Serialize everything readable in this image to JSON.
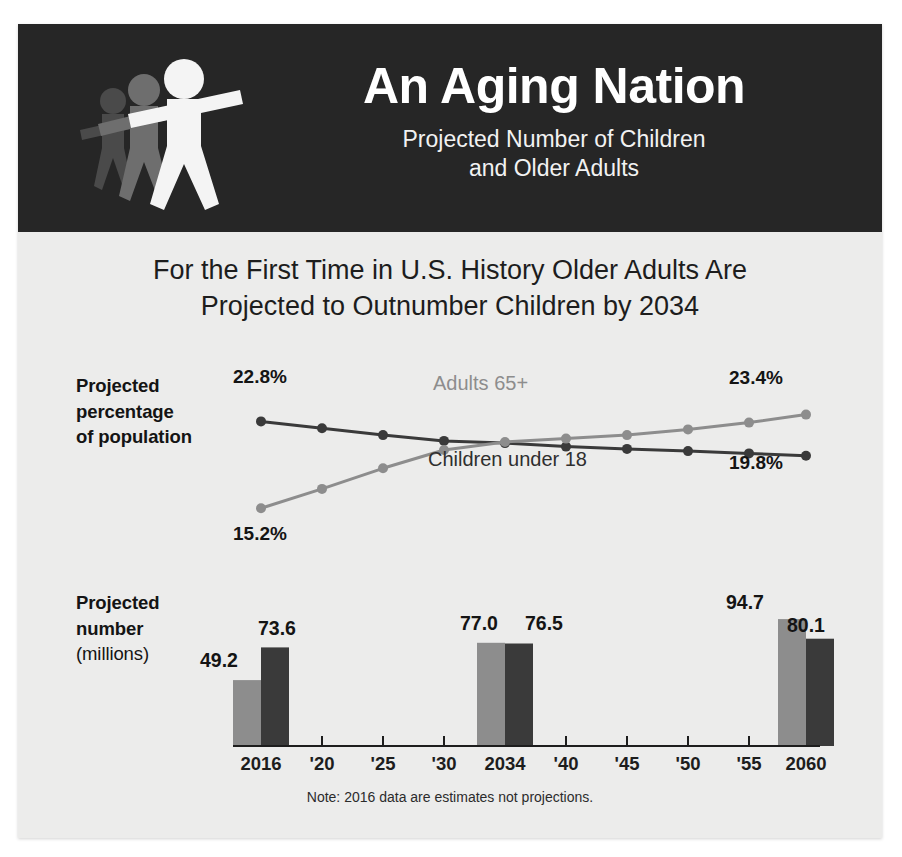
{
  "header": {
    "title": "An Aging Nation",
    "subtitle_line1": "Projected Number of Children",
    "subtitle_line2": "and Older Adults",
    "logo_name": "walking-people-pictogram"
  },
  "headline": {
    "line1": "For the First Time in U.S. History Older Adults Are",
    "line2": "Projected to Outnumber Children by 2034"
  },
  "labels": {
    "percentage_line1": "Projected",
    "percentage_line2": "percentage",
    "percentage_line3": "of population",
    "number_line1": "Projected",
    "number_line2": "number",
    "number_line3": "(millions)"
  },
  "note": "Note: 2016 data are estimates not projections.",
  "colors": {
    "band_background": "#262626",
    "page_background": "#ececeb",
    "adults_series": "#8d8d8d",
    "children_series": "#3a3a3a",
    "text_dark": "#141414"
  },
  "chart_data": [
    {
      "type": "line",
      "title": "Projected percentage of population",
      "xlabel": "",
      "ylabel": "percentage of population",
      "x": [
        "2016",
        "'20",
        "'25",
        "'30",
        "2034",
        "'40",
        "'45",
        "'50",
        "'55",
        "2060"
      ],
      "ylim": [
        14.0,
        24.5
      ],
      "grid": false,
      "legend": "inline-labels",
      "series": [
        {
          "name": "Children under 18",
          "color": "#3a3a3a",
          "values": [
            22.8,
            22.2,
            21.6,
            21.1,
            20.9,
            20.6,
            20.4,
            20.2,
            20.0,
            19.8
          ],
          "start_label": "22.8%",
          "end_label": "19.8%"
        },
        {
          "name": "Adults 65+",
          "color": "#8d8d8d",
          "values": [
            15.2,
            16.9,
            18.7,
            20.3,
            21.0,
            21.3,
            21.6,
            22.1,
            22.7,
            23.4
          ],
          "start_label": "15.2%",
          "end_label": "23.4%"
        }
      ],
      "annotations": [
        {
          "text": "Adults 65+",
          "color": "#8d8d8d"
        },
        {
          "text": "Children under 18",
          "color": "#2f2f2f"
        }
      ]
    },
    {
      "type": "bar",
      "title": "Projected number (millions)",
      "xlabel": "",
      "ylabel": "millions",
      "categories": [
        "2016",
        "'20",
        "'25",
        "'30",
        "2034",
        "'40",
        "'45",
        "'50",
        "'55",
        "2060"
      ],
      "bar_categories": [
        "2016",
        "2034",
        "2060"
      ],
      "ylim": [
        0,
        100
      ],
      "grid": false,
      "series": [
        {
          "name": "Adults 65+",
          "color": "#8d8d8d",
          "values": [
            49.2,
            77.0,
            94.7
          ],
          "labels": [
            "49.2",
            "77.0",
            "94.7"
          ]
        },
        {
          "name": "Children under 18",
          "color": "#3a3a3a",
          "values": [
            73.6,
            76.5,
            80.1
          ],
          "labels": [
            "73.6",
            "76.5",
            "80.1"
          ]
        }
      ]
    }
  ],
  "axis": {
    "ticks": [
      {
        "label": "2016",
        "x": 261
      },
      {
        "label": "'20",
        "x": 322
      },
      {
        "label": "'25",
        "x": 383
      },
      {
        "label": "'30",
        "x": 444
      },
      {
        "label": "2034",
        "x": 505
      },
      {
        "label": "'40",
        "x": 566
      },
      {
        "label": "'45",
        "x": 627
      },
      {
        "label": "'50",
        "x": 688
      },
      {
        "label": "'55",
        "x": 749
      },
      {
        "label": "2060",
        "x": 806
      }
    ]
  }
}
